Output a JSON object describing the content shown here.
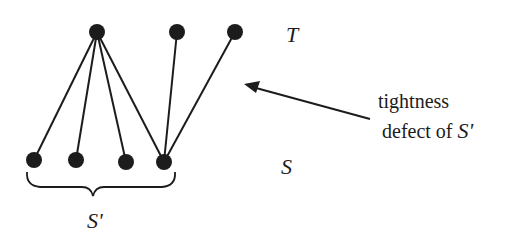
{
  "diagram": {
    "type": "bipartite-graph",
    "colors": {
      "ink": "#1c1c1c",
      "background": "#ffffff"
    },
    "top_set_label": "T",
    "bottom_set_label": "S",
    "subset_label": "S'",
    "annotation": {
      "line1": "tightness",
      "line2_prefix": "defect of ",
      "line2_symbol": "S'"
    },
    "nodes": {
      "top": [
        {
          "id": "t1",
          "x": 97,
          "y": 32
        },
        {
          "id": "t2",
          "x": 177,
          "y": 32
        },
        {
          "id": "t3",
          "x": 235,
          "y": 32
        }
      ],
      "bottom": [
        {
          "id": "s1",
          "x": 34,
          "y": 160,
          "in_subset": true
        },
        {
          "id": "s2",
          "x": 76,
          "y": 160,
          "in_subset": true
        },
        {
          "id": "s3",
          "x": 126,
          "y": 162,
          "in_subset": true
        },
        {
          "id": "s4",
          "x": 164,
          "y": 162,
          "in_subset": true
        }
      ]
    },
    "edges": [
      [
        "t1",
        "s1"
      ],
      [
        "t1",
        "s2"
      ],
      [
        "t1",
        "s3"
      ],
      [
        "t1",
        "s4"
      ],
      [
        "t2",
        "s4"
      ],
      [
        "t3",
        "s4"
      ]
    ]
  }
}
